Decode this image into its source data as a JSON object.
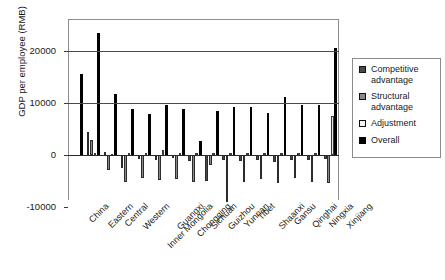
{
  "caption_remnant": "",
  "chart_data": {
    "type": "bar",
    "title": "",
    "xlabel": "",
    "ylabel": "GDP per employee (RMB)",
    "ylim": [
      -10000,
      25000
    ],
    "yticks": [
      -10000,
      0,
      10000,
      20000
    ],
    "ytick_labels": [
      "-10000",
      "0",
      "10000",
      "20000"
    ],
    "grid": true,
    "legend_position": "right",
    "categories": [
      "China",
      "Eastern",
      "Central",
      "Western",
      "Inner Mongolia",
      "Guangxi",
      "Chongqing",
      "Sichuan",
      "Guizhou",
      "Yunnan",
      "Tibet",
      "Shaanxi",
      "Gansu",
      "Qinghai",
      "Ningxia",
      "Xinjiang"
    ],
    "series": [
      {
        "name": "Competitive advantage",
        "color": "#4a4a4a",
        "values": [
          0,
          4400,
          600,
          -2500,
          -800,
          -1000,
          -600,
          -1100,
          -5000,
          -1000,
          -1200,
          -900,
          -1300,
          -1000,
          -900,
          -800
        ]
      },
      {
        "name": "Structural advantage",
        "color": "#8a8a8a",
        "values": [
          0,
          2900,
          -2800,
          -5100,
          -4400,
          -4800,
          -4600,
          -5200,
          -2000,
          -9000,
          -5100,
          -4700,
          -5300,
          -4500,
          -5200,
          -5400
        ]
      },
      {
        "name": "Adjustment",
        "color": "#e8e8e8",
        "values": [
          0,
          300,
          200,
          400,
          300,
          900,
          300,
          300,
          400,
          300,
          300,
          300,
          300,
          300,
          400,
          7500
        ]
      },
      {
        "name": "Overall",
        "color": "#000000",
        "values": [
          15500,
          23500,
          11700,
          8800,
          7800,
          9600,
          8800,
          2700,
          8400,
          9300,
          9200,
          8000,
          11100,
          9600,
          9600,
          20500
        ]
      }
    ]
  },
  "legend": {
    "items": [
      {
        "label": "Competitive advantage",
        "swatch": "competitive"
      },
      {
        "label": "Structural advantage",
        "swatch": "structural"
      },
      {
        "label": "Adjustment",
        "swatch": "adjustment"
      },
      {
        "label": "Overall",
        "swatch": "overall"
      }
    ]
  }
}
